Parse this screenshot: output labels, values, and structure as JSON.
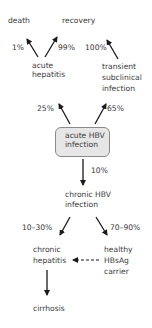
{
  "nodes": {
    "death": "death",
    "recovery": "recovery",
    "acute_hepatitis": [
      "acute",
      "hepatitis"
    ],
    "transient_subclinical": [
      "transient",
      "subclinical",
      "infection"
    ],
    "acute_hbv": [
      "acute HBV",
      "infection"
    ],
    "chronic_hbv": [
      "chronic HBV",
      "infection"
    ],
    "chronic_hepatitis": [
      "chronic",
      "hepatitis"
    ],
    "healthy_carrier": [
      "healthy",
      "HBsAg",
      "carrier"
    ],
    "cirrhosis": "cirrhosis"
  },
  "edges": {
    "acute_to_death": "1%",
    "acute_to_recovery": "99%",
    "transient_to_recovery": "100%",
    "hbv_to_acute": "25%",
    "hbv_to_transient": "65%",
    "hbv_to_chronic": "10%",
    "chronic_to_hepatitis": "10–30%",
    "chronic_to_carrier": "70–90%"
  },
  "colors": {
    "box_fill": "#e6e6e6",
    "box_border": "#8a8a8a",
    "arrow": "#1a1a1a"
  }
}
